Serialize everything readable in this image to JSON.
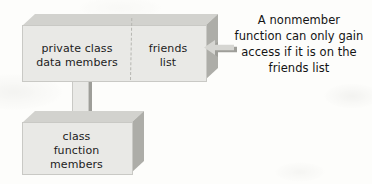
{
  "diagram": {
    "colors": {
      "block_front": "#e9e9e6",
      "block_top": "#d2d2ce",
      "block_side": "#adada8",
      "outline": "#c9c9c5",
      "text": "#1c1c1c",
      "background": "#fdfdfb"
    },
    "blocks": [
      {
        "id": "class-block",
        "sections": [
          {
            "id": "private-data-section",
            "label": "private class\ndata members"
          },
          {
            "id": "friends-list-section",
            "label": "friends\nlist"
          }
        ],
        "divider": "dashed-vertical"
      },
      {
        "id": "function-block",
        "label": "class\nfunction\nmembers"
      }
    ],
    "connectors": [
      {
        "id": "data-to-functions-connector",
        "shape": "vertical-bar",
        "from": "class-block",
        "to": "function-block"
      },
      {
        "id": "friends-access-arrow",
        "shape": "left-arrow",
        "points_to": "friends-list-section"
      }
    ],
    "caption": {
      "id": "nonmember-access-caption",
      "text": "A nonmember\nfunction can only gain\naccess if it is on the\nfriends list"
    }
  }
}
